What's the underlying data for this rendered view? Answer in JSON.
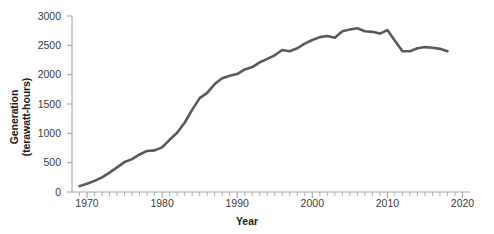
{
  "chart_data": {
    "type": "line",
    "title": "",
    "xlabel": "Year",
    "ylabel": "Generation (terawatt-hours)",
    "ylabel_line1": "Generation",
    "ylabel_line2": "(terawatt-hours)",
    "xlim": [
      1968,
      2021
    ],
    "ylim": [
      0,
      3000
    ],
    "ytick_values": [
      0,
      500,
      1000,
      1500,
      2000,
      2500,
      3000
    ],
    "ytick_labels": [
      "0",
      "500",
      "1000",
      "1500",
      "2000",
      "2500",
      "3000"
    ],
    "xtick_values": [
      1970,
      1980,
      1990,
      2000,
      2010,
      2020
    ],
    "xtick_labels": [
      "1970",
      "1980",
      "1990",
      "2000",
      "2010",
      "2020"
    ],
    "minor_xtick_step": 1,
    "grid": false,
    "legend": null,
    "line_color": "#595959",
    "axis_color": "#a6a6a6",
    "text_color": "#3a3a3a",
    "series": [
      {
        "name": "Generation",
        "x": [
          1969,
          1970,
          1971,
          1972,
          1973,
          1974,
          1975,
          1976,
          1977,
          1978,
          1979,
          1980,
          1981,
          1982,
          1983,
          1984,
          1985,
          1986,
          1987,
          1988,
          1989,
          1990,
          1991,
          1992,
          1993,
          1994,
          1995,
          1996,
          1997,
          1998,
          1999,
          2000,
          2001,
          2002,
          2003,
          2004,
          2005,
          2006,
          2007,
          2008,
          2009,
          2010,
          2011,
          2012,
          2013,
          2014,
          2015,
          2016,
          2017,
          2018
        ],
        "y": [
          100,
          140,
          190,
          250,
          330,
          420,
          510,
          560,
          640,
          700,
          710,
          760,
          890,
          1010,
          1180,
          1400,
          1600,
          1690,
          1840,
          1940,
          1980,
          2010,
          2090,
          2130,
          2210,
          2270,
          2330,
          2420,
          2400,
          2450,
          2530,
          2590,
          2640,
          2660,
          2630,
          2740,
          2770,
          2790,
          2740,
          2730,
          2700,
          2760,
          2580,
          2400,
          2400,
          2450,
          2470,
          2460,
          2440,
          2400
        ]
      }
    ]
  }
}
